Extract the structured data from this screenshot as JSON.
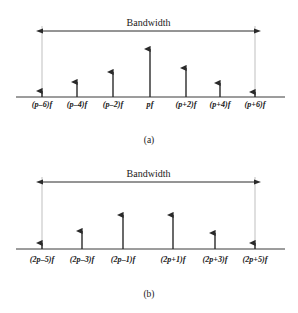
{
  "figure": {
    "panels": [
      {
        "caption": "(a)",
        "bandwidth_label": "Bandwidth",
        "baseline_y": 97,
        "bandwidth_y": 31,
        "bandwidth_x1": 42,
        "bandwidth_x2": 255,
        "caption_y": 143,
        "label_y": 107,
        "ticks": [
          {
            "label": "(p–6)f",
            "x": 42,
            "tip_y": 86
          },
          {
            "label": "(p–4)f",
            "x": 77,
            "tip_y": 77
          },
          {
            "label": "(p–2)f",
            "x": 113,
            "tip_y": 67
          },
          {
            "label": "pf",
            "x": 150,
            "tip_y": 44
          },
          {
            "label": "(p+2)f",
            "x": 186,
            "tip_y": 63
          },
          {
            "label": "(p+4)f",
            "x": 220,
            "tip_y": 78
          },
          {
            "label": "(p+6)f",
            "x": 255,
            "tip_y": 87
          }
        ]
      },
      {
        "caption": "(b)",
        "bandwidth_label": "Bandwidth",
        "baseline_y": 249,
        "bandwidth_y": 182,
        "bandwidth_x1": 42,
        "bandwidth_x2": 255,
        "caption_y": 297,
        "label_y": 262,
        "ticks": [
          {
            "label": "(2p–5)f",
            "x": 42,
            "tip_y": 238
          },
          {
            "label": "(2p–3)f",
            "x": 82,
            "tip_y": 226
          },
          {
            "label": "(2p–1)f",
            "x": 123,
            "tip_y": 210
          },
          {
            "label": "(2p+1)f",
            "x": 173,
            "tip_y": 210
          },
          {
            "label": "(2p+3)f",
            "x": 215,
            "tip_y": 228
          },
          {
            "label": "(2p+5)f",
            "x": 255,
            "tip_y": 238
          }
        ]
      }
    ],
    "axis_x_start": 16,
    "axis_x_end": 285,
    "colors": {
      "stroke": "#2a2a2a",
      "axis": "#3a3a3a",
      "guide": "#b8b8b8",
      "background": "#ffffff"
    }
  },
  "chart_data": {
    "type": "bar",
    "subtitle": "",
    "xlabel": "",
    "ylabel": "",
    "panels": [
      {
        "name": "(a)",
        "annotation": "Bandwidth",
        "categories": [
          "(p–6)f",
          "(p–4)f",
          "(p–2)f",
          "pf",
          "(p+2)f",
          "(p+4)f",
          "(p+6)f"
        ],
        "values": [
          11,
          20,
          30,
          53,
          34,
          19,
          10
        ]
      },
      {
        "name": "(b)",
        "annotation": "Bandwidth",
        "categories": [
          "(2p–5)f",
          "(2p–3)f",
          "(2p–1)f",
          "(2p+1)f",
          "(2p+3)f",
          "(2p+5)f"
        ],
        "values": [
          11,
          23,
          39,
          39,
          21,
          11
        ]
      }
    ],
    "grid": false,
    "legend": "none"
  }
}
